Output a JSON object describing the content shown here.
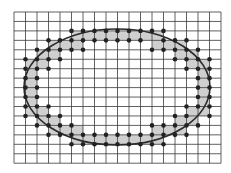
{
  "diagram": {
    "colors": {
      "background": "#ffffff",
      "grid_line": "#3a3a3a",
      "shaded_cell": "#cfcfcf",
      "dot": "#222222",
      "ellipse": "#2a2a2a"
    },
    "grid": {
      "origin_x": 14,
      "origin_y": 12,
      "cols": 18,
      "rows": 16,
      "cell_width": 11.5,
      "cell_height": 9.45
    },
    "ellipse": {
      "cx": 117,
      "cy": 87,
      "rx": 93,
      "ry": 58
    },
    "shaded_cells": [
      [
        5,
        2
      ],
      [
        6,
        2
      ],
      [
        7,
        2
      ],
      [
        8,
        2
      ],
      [
        9,
        2
      ],
      [
        10,
        2
      ],
      [
        11,
        2
      ],
      [
        12,
        2
      ],
      [
        3,
        3
      ],
      [
        4,
        3
      ],
      [
        5,
        3
      ],
      [
        12,
        3
      ],
      [
        13,
        3
      ],
      [
        14,
        3
      ],
      [
        2,
        4
      ],
      [
        3,
        4
      ],
      [
        14,
        4
      ],
      [
        15,
        4
      ],
      [
        1,
        5
      ],
      [
        2,
        5
      ],
      [
        15,
        5
      ],
      [
        16,
        5
      ],
      [
        1,
        6
      ],
      [
        16,
        6
      ],
      [
        1,
        7
      ],
      [
        16,
        7
      ],
      [
        1,
        8
      ],
      [
        16,
        8
      ],
      [
        1,
        9
      ],
      [
        16,
        9
      ],
      [
        1,
        10
      ],
      [
        2,
        10
      ],
      [
        15,
        10
      ],
      [
        16,
        10
      ],
      [
        2,
        11
      ],
      [
        3,
        11
      ],
      [
        14,
        11
      ],
      [
        15,
        11
      ],
      [
        3,
        12
      ],
      [
        4,
        12
      ],
      [
        5,
        12
      ],
      [
        12,
        12
      ],
      [
        13,
        12
      ],
      [
        14,
        12
      ],
      [
        5,
        13
      ],
      [
        6,
        13
      ],
      [
        7,
        13
      ],
      [
        8,
        13
      ],
      [
        9,
        13
      ],
      [
        10,
        13
      ],
      [
        11,
        13
      ],
      [
        12,
        13
      ]
    ],
    "dots": [
      [
        5,
        2
      ],
      [
        6,
        2
      ],
      [
        7,
        2
      ],
      [
        8,
        2
      ],
      [
        9,
        2
      ],
      [
        10,
        2
      ],
      [
        11,
        2
      ],
      [
        12,
        2
      ],
      [
        13,
        2
      ],
      [
        3,
        3
      ],
      [
        4,
        3
      ],
      [
        5,
        3
      ],
      [
        6,
        3
      ],
      [
        7,
        3
      ],
      [
        8,
        3
      ],
      [
        9,
        3
      ],
      [
        10,
        3
      ],
      [
        11,
        3
      ],
      [
        13,
        3
      ],
      [
        14,
        3
      ],
      [
        15,
        3
      ],
      [
        2,
        4
      ],
      [
        3,
        4
      ],
      [
        4,
        4
      ],
      [
        5,
        4
      ],
      [
        6,
        4
      ],
      [
        12,
        4
      ],
      [
        13,
        4
      ],
      [
        14,
        4
      ],
      [
        15,
        4
      ],
      [
        16,
        4
      ],
      [
        1,
        5
      ],
      [
        2,
        5
      ],
      [
        3,
        5
      ],
      [
        4,
        5
      ],
      [
        14,
        5
      ],
      [
        15,
        5
      ],
      [
        16,
        5
      ],
      [
        17,
        5
      ],
      [
        1,
        6
      ],
      [
        2,
        6
      ],
      [
        3,
        6
      ],
      [
        15,
        6
      ],
      [
        16,
        6
      ],
      [
        17,
        6
      ],
      [
        1,
        7
      ],
      [
        2,
        7
      ],
      [
        16,
        7
      ],
      [
        17,
        7
      ],
      [
        1,
        8
      ],
      [
        2,
        8
      ],
      [
        16,
        8
      ],
      [
        17,
        8
      ],
      [
        1,
        9
      ],
      [
        2,
        9
      ],
      [
        16,
        9
      ],
      [
        17,
        9
      ],
      [
        1,
        10
      ],
      [
        2,
        10
      ],
      [
        3,
        10
      ],
      [
        15,
        10
      ],
      [
        16,
        10
      ],
      [
        17,
        10
      ],
      [
        1,
        11
      ],
      [
        2,
        11
      ],
      [
        3,
        11
      ],
      [
        4,
        11
      ],
      [
        14,
        11
      ],
      [
        15,
        11
      ],
      [
        17,
        11
      ],
      [
        2,
        12
      ],
      [
        3,
        12
      ],
      [
        4,
        12
      ],
      [
        5,
        12
      ],
      [
        12,
        12
      ],
      [
        13,
        12
      ],
      [
        14,
        12
      ],
      [
        15,
        12
      ],
      [
        16,
        12
      ],
      [
        3,
        13
      ],
      [
        4,
        13
      ],
      [
        5,
        13
      ],
      [
        6,
        13
      ],
      [
        7,
        13
      ],
      [
        8,
        13
      ],
      [
        9,
        13
      ],
      [
        10,
        13
      ],
      [
        11,
        13
      ],
      [
        12,
        13
      ],
      [
        13,
        13
      ],
      [
        14,
        13
      ],
      [
        15,
        13
      ],
      [
        5,
        14
      ],
      [
        6,
        14
      ],
      [
        7,
        14
      ],
      [
        8,
        14
      ],
      [
        9,
        14
      ],
      [
        10,
        14
      ],
      [
        11,
        14
      ],
      [
        12,
        14
      ],
      [
        13,
        14
      ]
    ],
    "dot_radius": 2.3
  }
}
